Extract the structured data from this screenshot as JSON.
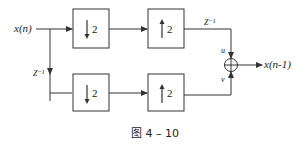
{
  "diagram": {
    "input_label": "x(n)",
    "output_label": "x(n-1)",
    "delay_left_label": "Z⁻¹",
    "delay_top_label": "Z⁻¹",
    "adder_input_top": "u",
    "adder_input_bottom": "v",
    "blocks": {
      "top_down": {
        "arrow": "down",
        "factor": "2"
      },
      "top_up": {
        "arrow": "up",
        "factor": "2"
      },
      "bottom_down": {
        "arrow": "down",
        "factor": "2"
      },
      "bottom_up": {
        "arrow": "up",
        "factor": "2"
      }
    },
    "adder_symbol": "sum-circle-plus"
  },
  "caption": "图 4 – 10",
  "colors": {
    "line": "#333333",
    "background": "#ffffff"
  }
}
